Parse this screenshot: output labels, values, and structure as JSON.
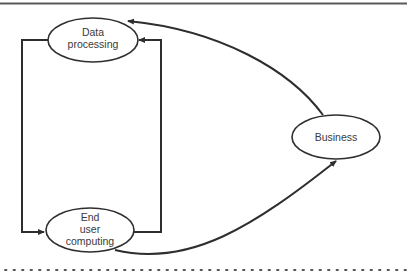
{
  "diagram": {
    "type": "flow",
    "nodes": [
      {
        "id": "data-processing",
        "lines": [
          "Data",
          "processing"
        ]
      },
      {
        "id": "end-user-computing",
        "lines": [
          "End",
          "user",
          "computing"
        ]
      },
      {
        "id": "business",
        "lines": [
          "Business"
        ]
      }
    ],
    "edges": [
      {
        "from": "end-user-computing",
        "to": "data-processing",
        "style": "orthogonal-right"
      },
      {
        "from": "data-processing",
        "to": "end-user-computing",
        "style": "orthogonal-left"
      },
      {
        "from": "business",
        "to": "data-processing",
        "style": "curve"
      },
      {
        "from": "end-user-computing",
        "to": "business",
        "style": "curve"
      }
    ]
  },
  "colors": {
    "stroke": "#2e2e2e",
    "text": "#3a3a3a",
    "background": "#ffffff"
  }
}
